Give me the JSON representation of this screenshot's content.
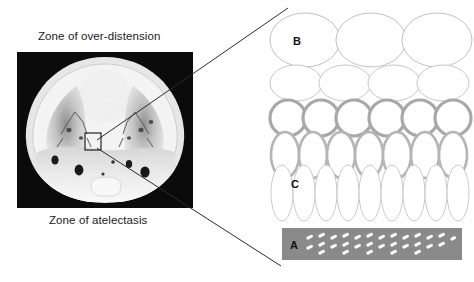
{
  "figure": {
    "background_color": "#ffffff"
  },
  "left_panel": {
    "labels": {
      "top": "Zone of over-distension",
      "bottom": "Zone of atelectasis"
    },
    "ct_scan": {
      "name": "thoracic-ct-axial-slice",
      "description": "Axial chest CT showing anterior over-distended lung and dependent posterior consolidation",
      "background_color": "#0d0d0d",
      "roi_box": {
        "label": "",
        "x": 68,
        "y": 81,
        "width": 16,
        "height": 17,
        "stroke_color": "#111111"
      }
    }
  },
  "leader_lines": {
    "stroke_color": "#2b2b2b",
    "upper": {
      "x1": 97,
      "y1": 140,
      "x2": 288,
      "y2": 8
    },
    "lower": {
      "x1": 97,
      "y1": 148,
      "x2": 281,
      "y2": 266
    }
  },
  "right_panel": {
    "name": "alveoli-schematic",
    "zone_labels": [
      {
        "key": "B",
        "text": "B",
        "x": 31,
        "y": 45,
        "color": "#111111"
      },
      {
        "key": "C",
        "text": "C",
        "x": 29,
        "y": 188,
        "color": "#111111"
      },
      {
        "key": "A",
        "text": "A",
        "x": 28,
        "y": 244,
        "color": "#111111"
      }
    ],
    "rows": [
      {
        "name": "row-over-distended-large",
        "count": 3,
        "rx": 35,
        "ry": 27,
        "cy": 40,
        "start_x": 39,
        "step_x": 66,
        "stroke": "#b9b9b9",
        "stroke_width": 0.9,
        "fill": "#ffffff"
      },
      {
        "name": "row-over-distended-medium",
        "count": 4,
        "rx": 26,
        "ry": 18,
        "cy": 83,
        "start_x": 30,
        "step_x": 49,
        "stroke": "#c0c0c0",
        "stroke_width": 0.9,
        "fill": "#ffffff"
      },
      {
        "name": "row-normal-round",
        "count": 6,
        "rx": 18,
        "ry": 18,
        "cy": 118,
        "start_x": 22,
        "step_x": 33,
        "stroke": "#a8a8a8",
        "stroke_width": 3.2,
        "fill": "#ffffff"
      },
      {
        "name": "row-normal-oval",
        "count": 7,
        "rx": 14,
        "ry": 23,
        "cy": 155,
        "start_x": 19,
        "step_x": 28,
        "stroke": "#b5b5b5",
        "stroke_width": 2.6,
        "fill": "#ffffff"
      },
      {
        "name": "row-collapsing-narrow",
        "count": 9,
        "rx": 11,
        "ry": 28,
        "cy": 193,
        "start_x": 16,
        "step_x": 22,
        "stroke": "#c4c4c4",
        "stroke_width": 0.9,
        "fill": "#ffffff"
      }
    ],
    "atelectasis_band": {
      "name": "atelectasis-band",
      "x": 16,
      "y": 228,
      "width": 180,
      "height": 32,
      "fill": "#8a8a8a",
      "dash_color": "#ffffff",
      "dash_count": 46
    }
  },
  "colors": {
    "ink": "#1a1a1a",
    "leader": "#2b2b2b",
    "alveolus_stroke": "#b9b9b9",
    "alveolus_stroke_thick": "#a8a8a8",
    "band_gray": "#8a8a8a"
  }
}
